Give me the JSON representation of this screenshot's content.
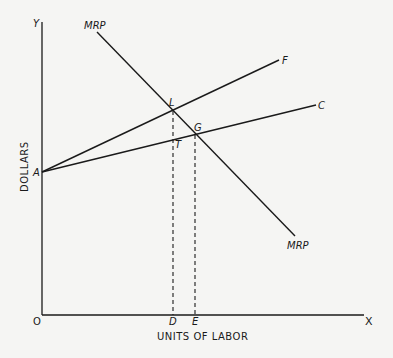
{
  "diagram": {
    "type": "economics-labor-market",
    "axes": {
      "y_axis_label": "Y",
      "x_axis_label": "X",
      "origin_label": "O",
      "y_title": "DOLLARS",
      "x_title": "UNITS OF LABOR"
    },
    "curves": {
      "mrp_top_label": "MRP",
      "mrp_bottom_label": "MRP",
      "f_label": "F",
      "c_label": "C"
    },
    "points": {
      "a_label": "A",
      "l_label": "L",
      "g_label": "G",
      "t_label": "T",
      "d_label": "D",
      "e_label": "E"
    },
    "colors": {
      "ink": "#1a1a1a",
      "paper": "#f5f5f3"
    }
  }
}
